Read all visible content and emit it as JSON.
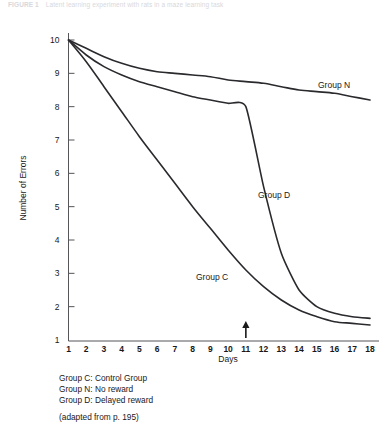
{
  "caption": {
    "label": "FIGURE 1",
    "text": "Latent learning experiment with rats in a maze learning task"
  },
  "chart_data": {
    "type": "line",
    "title": "",
    "xlabel": "Days",
    "ylabel": "Number of Errors",
    "xlim": [
      1,
      18
    ],
    "ylim": [
      1,
      10
    ],
    "xticks": [
      "1",
      "2",
      "3",
      "4",
      "5",
      "6",
      "7",
      "8",
      "9",
      "10",
      "11",
      "12",
      "13",
      "14",
      "15",
      "16",
      "17",
      "18"
    ],
    "yticks": [
      "1",
      "2",
      "3",
      "4",
      "5",
      "6",
      "7",
      "8",
      "9",
      "10"
    ],
    "grid": false,
    "legend_position": "inline-labels",
    "x": [
      1,
      2,
      3,
      4,
      5,
      6,
      7,
      8,
      9,
      10,
      11,
      12,
      13,
      14,
      15,
      16,
      17,
      18
    ],
    "series": [
      {
        "name": "Group N",
        "label": "Group N",
        "values": [
          10.0,
          9.75,
          9.5,
          9.3,
          9.15,
          9.05,
          9.0,
          8.95,
          8.9,
          8.8,
          8.75,
          8.7,
          8.6,
          8.5,
          8.45,
          8.4,
          8.3,
          8.2
        ]
      },
      {
        "name": "Group D",
        "label": "Group D",
        "values": [
          10.0,
          9.55,
          9.2,
          8.95,
          8.75,
          8.6,
          8.45,
          8.3,
          8.2,
          8.1,
          8.0,
          5.6,
          3.6,
          2.5,
          2.0,
          1.8,
          1.7,
          1.65
        ]
      },
      {
        "name": "Group C",
        "label": "Group C",
        "values": [
          10.0,
          9.35,
          8.6,
          7.85,
          7.1,
          6.4,
          5.7,
          5.0,
          4.35,
          3.7,
          3.1,
          2.6,
          2.2,
          1.9,
          1.7,
          1.55,
          1.5,
          1.45
        ]
      }
    ],
    "annotations": [
      {
        "name": "reward-introduced-marker",
        "type": "arrow",
        "x": 11,
        "description": "arrow pointing up at day 11"
      }
    ]
  },
  "legend": {
    "items": [
      "Group C: Control Group",
      "Group N: No reward",
      "Group D: Delayed reward"
    ]
  },
  "source_note": "(adapted from p. 195)"
}
